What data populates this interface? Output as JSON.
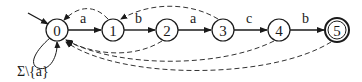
{
  "diagram": {
    "type": "finite-automaton",
    "states": [
      {
        "id": "0",
        "label": "0",
        "x": 57,
        "y": 30,
        "initial": true,
        "accepting": false
      },
      {
        "id": "1",
        "label": "1",
        "x": 113,
        "y": 30,
        "initial": false,
        "accepting": false
      },
      {
        "id": "2",
        "label": "2",
        "x": 167,
        "y": 30,
        "initial": false,
        "accepting": false
      },
      {
        "id": "3",
        "label": "3",
        "x": 223,
        "y": 30,
        "initial": false,
        "accepting": false
      },
      {
        "id": "4",
        "label": "4",
        "x": 279,
        "y": 30,
        "initial": false,
        "accepting": false
      },
      {
        "id": "5",
        "label": "5",
        "x": 337,
        "y": 30,
        "initial": false,
        "accepting": true
      }
    ],
    "transitions": [
      {
        "from": "0",
        "to": "1",
        "label": "a",
        "style": "solid"
      },
      {
        "from": "1",
        "to": "2",
        "label": "b",
        "style": "solid"
      },
      {
        "from": "2",
        "to": "3",
        "label": "a",
        "style": "solid"
      },
      {
        "from": "3",
        "to": "4",
        "label": "c",
        "style": "solid"
      },
      {
        "from": "4",
        "to": "5",
        "label": "b",
        "style": "solid"
      },
      {
        "from": "0",
        "to": "0",
        "label": "Σ\\{a}",
        "style": "solid"
      },
      {
        "from": "1",
        "to": "0",
        "label": "",
        "style": "dashed"
      },
      {
        "from": "3",
        "to": "1",
        "label": "",
        "style": "dashed"
      },
      {
        "from": "2",
        "to": "0",
        "label": "",
        "style": "dashed"
      },
      {
        "from": "4",
        "to": "0",
        "label": "",
        "style": "dashed"
      },
      {
        "from": "5",
        "to": "0",
        "label": "",
        "style": "dashed"
      }
    ],
    "labels": {
      "s0": "0",
      "s1": "1",
      "s2": "2",
      "s3": "3",
      "s4": "4",
      "s5": "5",
      "t01": "a",
      "t12": "b",
      "t23": "a",
      "t34": "c",
      "t45": "b",
      "self_loop": "Σ\\{a}"
    }
  }
}
